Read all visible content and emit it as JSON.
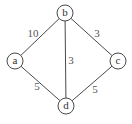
{
  "graph": {
    "nodes": [
      {
        "id": "a",
        "label": "a",
        "x": 15,
        "y": 61
      },
      {
        "id": "b",
        "label": "b",
        "x": 65,
        "y": 13
      },
      {
        "id": "c",
        "label": "c",
        "x": 118,
        "y": 61
      },
      {
        "id": "d",
        "label": "d",
        "x": 66,
        "y": 106
      }
    ],
    "edges": [
      {
        "from": "a",
        "to": "b",
        "weight": "10",
        "label_x": 33,
        "label_y": 33
      },
      {
        "from": "b",
        "to": "c",
        "weight": "3",
        "label_x": 97,
        "label_y": 33
      },
      {
        "from": "b",
        "to": "d",
        "weight": "3",
        "label_x": 70,
        "label_y": 60
      },
      {
        "from": "a",
        "to": "d",
        "weight": "5",
        "label_x": 37,
        "label_y": 86
      },
      {
        "from": "d",
        "to": "c",
        "weight": "5",
        "label_x": 95,
        "label_y": 89
      }
    ]
  }
}
